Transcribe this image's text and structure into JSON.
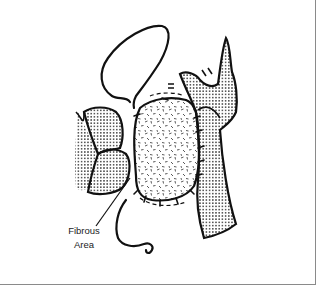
{
  "figure": {
    "type": "anatomical line illustration",
    "labels": [
      {
        "id": "fibrous-area",
        "line1": "Fibrous",
        "line2": "Area"
      }
    ],
    "colors": {
      "ink": "#111111",
      "border": "#8a8a8a",
      "background": "#ffffff"
    }
  }
}
